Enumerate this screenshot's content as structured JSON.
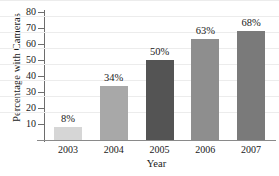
{
  "chart_data": {
    "type": "bar",
    "title": "",
    "xlabel": "Year",
    "ylabel": "Percentage with Cameras",
    "categories": [
      "2003",
      "2004",
      "2005",
      "2006",
      "2007"
    ],
    "values": [
      8,
      34,
      50,
      63,
      68
    ],
    "point_labels": [
      "8%",
      "34%",
      "50%",
      "63%",
      "68%"
    ],
    "bar_colors": [
      "#d6d6d6",
      "#a8a8a8",
      "#545454",
      "#8e8e8e",
      "#7a7a7a"
    ],
    "ylim": [
      0,
      80
    ],
    "yticks": [
      10,
      20,
      30,
      40,
      50,
      60,
      70,
      80
    ],
    "ytick_labels": [
      "10",
      "20",
      "30",
      "40",
      "50",
      "60",
      "70",
      "80"
    ],
    "grid": true,
    "legend": "none"
  },
  "axis": {
    "y_title": "Percentage with Cameras",
    "x_title": "Year"
  }
}
